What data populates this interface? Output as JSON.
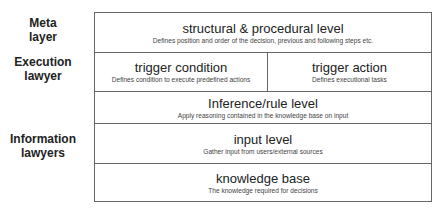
{
  "side_labels": {
    "meta": "Meta\nlayer",
    "meta_line1": "Meta",
    "meta_line2": "layer",
    "execution_line1": "Execution",
    "execution_line2": "lawyer",
    "information_line1": "Information",
    "information_line2": "lawyers"
  },
  "levels": [
    {
      "title": "structural & procedural level",
      "description": "Defines position and order of the decision, previous and following steps etc."
    },
    {
      "title": "trigger condition",
      "description": "Defines condition to execute predefined actions"
    },
    {
      "title": "trigger action",
      "description": "Defines executional tasks"
    },
    {
      "title": "Inference/rule level",
      "description": "Apply reasoning contained in the knowledge base on input"
    },
    {
      "title": "input level",
      "description": "Gather input from users/external sources"
    },
    {
      "title": "knowledge base",
      "description": "The knowledge required for decisions"
    }
  ],
  "colors": {
    "border": "#666666",
    "text": "#222222",
    "background": "#ffffff"
  }
}
